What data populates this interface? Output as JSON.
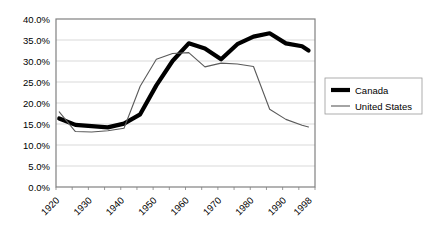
{
  "chart_data": {
    "type": "line",
    "title": "",
    "xlabel": "",
    "ylabel": "",
    "ylim": [
      0,
      40
    ],
    "xlim": [
      1920,
      2000
    ],
    "grid": true,
    "legend_position": "right",
    "y_ticks": [
      "0.0%",
      "5.0%",
      "10.0%",
      "15.0%",
      "20.0%",
      "25.0%",
      "30.0%",
      "35.0%",
      "40.0%"
    ],
    "y_tick_values": [
      0,
      5,
      10,
      15,
      20,
      25,
      30,
      35,
      40
    ],
    "x_tick_labels": [
      "1920",
      "1930",
      "1940",
      "1950",
      "1960",
      "1970",
      "1980",
      "1990",
      "1998"
    ],
    "x_tick_values": [
      1920,
      1930,
      1940,
      1950,
      1960,
      1970,
      1980,
      1990,
      1998
    ],
    "x": [
      1921,
      1926,
      1931,
      1936,
      1941,
      1946,
      1951,
      1956,
      1961,
      1966,
      1971,
      1976,
      1981,
      1986,
      1991,
      1996,
      1998
    ],
    "series": [
      {
        "name": "Canada",
        "color": "#000000",
        "style": "thick",
        "values": [
          16.3,
          14.8,
          14.5,
          14.2,
          15.1,
          17.3,
          24.2,
          30.0,
          34.2,
          33.0,
          30.4,
          34.0,
          35.8,
          36.6,
          34.2,
          33.5,
          32.5
        ]
      },
      {
        "name": "United States",
        "color": "#5a5a5a",
        "style": "thin",
        "values": [
          17.9,
          13.2,
          13.1,
          13.4,
          14.0,
          24.0,
          30.4,
          31.8,
          32.0,
          28.6,
          29.5,
          29.3,
          28.7,
          18.5,
          16.1,
          14.7,
          14.3
        ]
      }
    ]
  },
  "legend": {
    "items": [
      {
        "label": "Canada",
        "swatch": "thick-black-line"
      },
      {
        "label": "United States",
        "swatch": "thin-gray-line"
      }
    ]
  }
}
